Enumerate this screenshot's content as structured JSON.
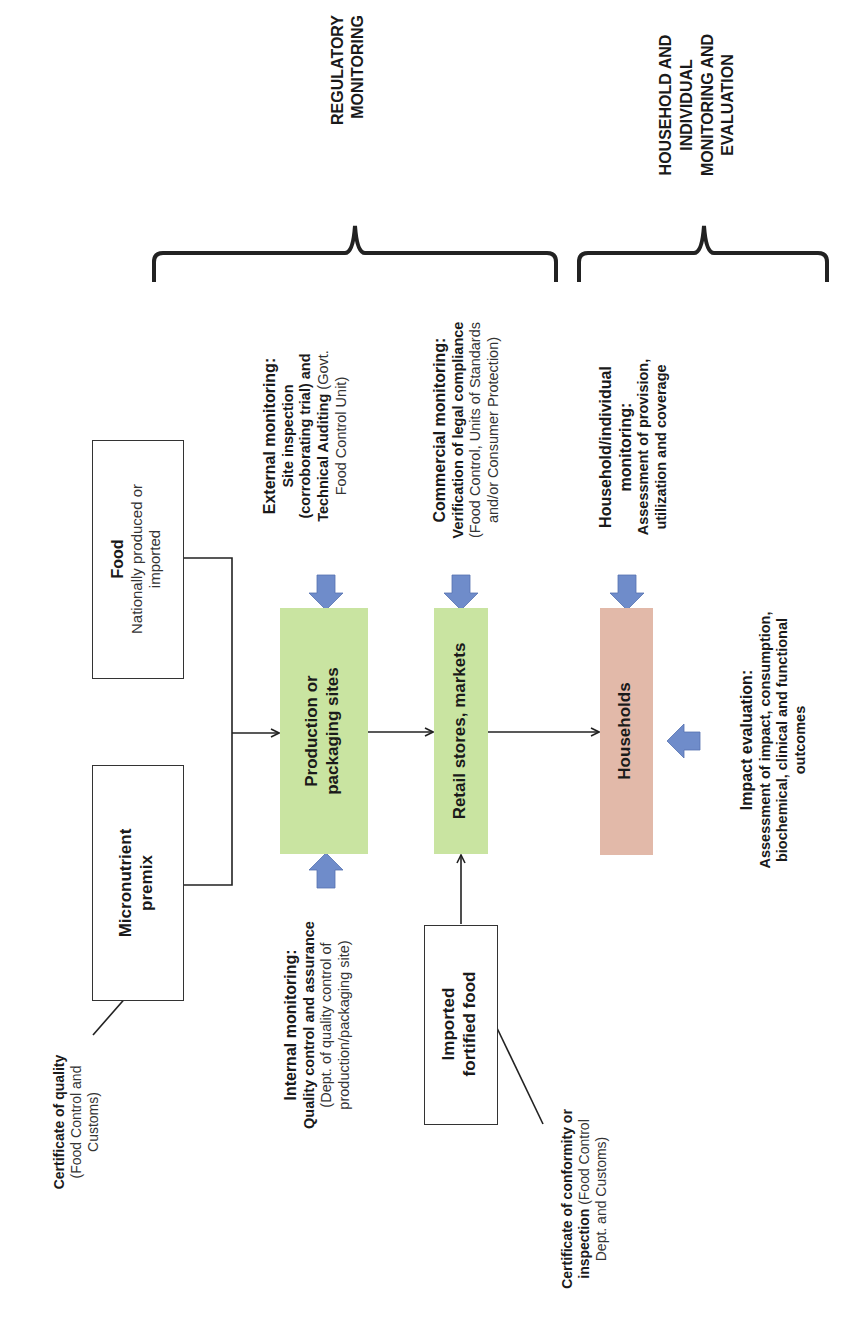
{
  "diagram": {
    "brackets": {
      "regulatory": {
        "label_line1": "REGULATORY",
        "label_line2": "MONITORING"
      },
      "household": {
        "label_line1": "HOUSEHOLD AND",
        "label_line2": "INDIVIDUAL",
        "label_line3": "MONITORING AND",
        "label_line4": "EVALUATION"
      }
    },
    "nodes": {
      "food": {
        "title": "Food",
        "line1": "Nationally produced or",
        "line2": "imported"
      },
      "premix": {
        "line1": "Micronutrient",
        "line2": "premix"
      },
      "production": {
        "line1": "Production or",
        "line2": "packaging sites"
      },
      "retail": {
        "label": "Retail stores, markets"
      },
      "households": {
        "label": "Households"
      },
      "imported": {
        "line1": "Imported",
        "line2": "fortified food"
      }
    },
    "annotations": {
      "external": {
        "title": "External monitoring:",
        "line1": "Site inspection",
        "line2": "(corroborating trial) and",
        "line3_bold": "Technical Auditing",
        "line3_rest": " (Govt.",
        "line4": "Food Control Unit)"
      },
      "commercial": {
        "title": "Commercial monitoring:",
        "line1": "Verification of legal compliance",
        "line2": "(Food Control, Units of Standards",
        "line3": "and/or Consumer Protection)"
      },
      "household_monitoring": {
        "title1": "Household/individual",
        "title2": "monitoring:",
        "line1": "Assessment of provision,",
        "line2": "utilization and coverage"
      },
      "impact": {
        "title": "Impact evaluation:",
        "line1": "Assessment of impact, consumption,",
        "line2": "biochemical, clinical  and functional",
        "line3": "outcomes"
      },
      "internal": {
        "title": "Internal monitoring:",
        "line1": "Quality control and assurance",
        "line2": "(Dept. of quality control of",
        "line3": "production/packaging site)"
      },
      "cert_quality": {
        "title": "Certificate of quality",
        "line1": "(Food Control and",
        "line2": "Customs)"
      },
      "cert_conformity": {
        "title1": "Certificate of conformity or",
        "title2_bold": "inspection",
        "title2_rest": " (Food Control",
        "line3": "Dept. and Customs)"
      }
    },
    "colors": {
      "production_fill": "#c9e4a1",
      "retail_fill": "#c9e4a1",
      "households_fill": "#e2b9a9",
      "block_arrow": "#6f8cca",
      "line": "#222222"
    }
  }
}
